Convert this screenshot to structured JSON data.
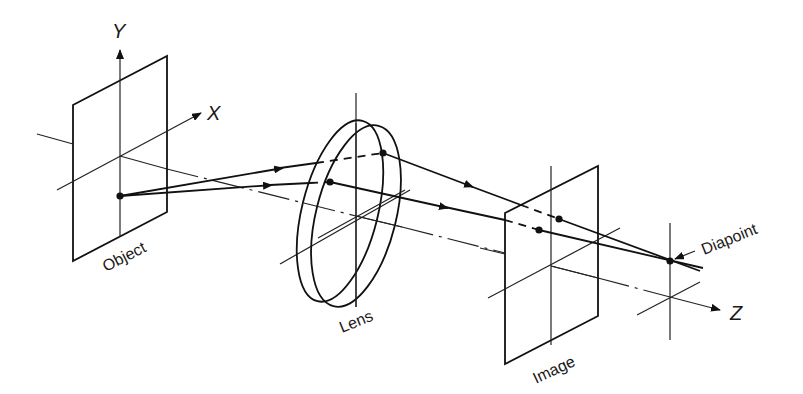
{
  "diagram": {
    "axes": {
      "x_label": "X",
      "y_label": "Y",
      "z_label": "Z"
    },
    "components": {
      "object_label": "Object",
      "lens_label": "Lens",
      "image_label": "Image",
      "diapoint_label": "Diapoint"
    },
    "colors": {
      "stroke": "#111111",
      "background": "#ffffff"
    }
  }
}
